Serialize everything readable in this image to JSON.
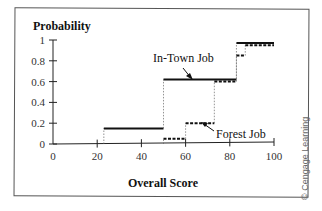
{
  "chart_data": {
    "type": "line",
    "step": true,
    "title": "",
    "xlabel": "Overall Score",
    "ylabel": "Probability",
    "xlim": [
      0,
      100
    ],
    "ylim": [
      0,
      1
    ],
    "xticks": [
      0,
      20,
      40,
      60,
      80,
      100
    ],
    "yticks": [
      0,
      0.2,
      0.4,
      0.6,
      0.8,
      1
    ],
    "xtick_labels": [
      "0",
      "20",
      "40",
      "60",
      "80",
      "100"
    ],
    "ytick_labels": [
      "0",
      "0.2",
      "0.4",
      "0.6",
      "0.8",
      "1"
    ],
    "grid": false,
    "series": [
      {
        "name": "In-Town Job",
        "style": "solid",
        "points": [
          [
            0,
            0
          ],
          [
            23,
            0
          ],
          [
            23,
            0.15
          ],
          [
            50,
            0.15
          ],
          [
            50,
            0.62
          ],
          [
            83,
            0.62
          ],
          [
            83,
            0.97
          ],
          [
            100,
            0.97
          ]
        ]
      },
      {
        "name": "Forest Job",
        "style": "dashed",
        "points": [
          [
            0,
            0
          ],
          [
            50,
            0
          ],
          [
            50,
            0.05
          ],
          [
            60,
            0.05
          ],
          [
            60,
            0.2
          ],
          [
            73,
            0.2
          ],
          [
            73,
            0.6
          ],
          [
            83,
            0.6
          ],
          [
            83,
            0.85
          ],
          [
            87,
            0.85
          ],
          [
            87,
            0.95
          ],
          [
            100,
            0.95
          ]
        ]
      }
    ],
    "annotations": [
      {
        "text": "In-Town Job",
        "target_series": "In-Town Job"
      },
      {
        "text": "Forest Job",
        "target_series": "Forest Job"
      }
    ]
  },
  "labels": {
    "ylabel": "Probability",
    "xlabel": "Overall Score",
    "intown": "In-Town Job",
    "forest": "Forest Job",
    "credit": "© Cengage Learning"
  }
}
